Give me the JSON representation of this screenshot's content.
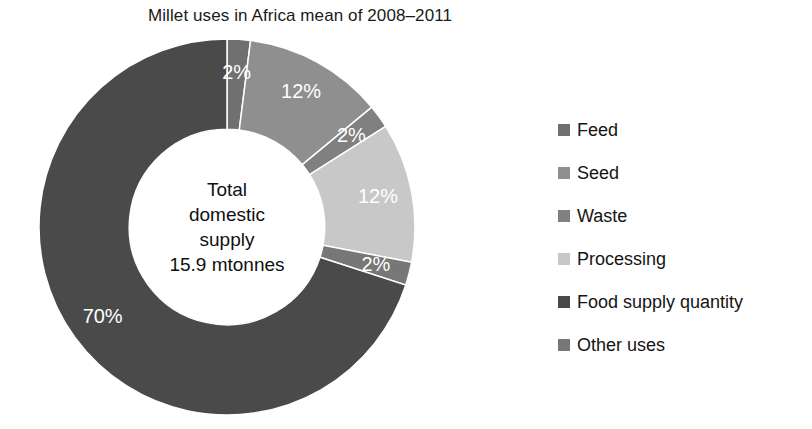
{
  "chart_data": {
    "type": "pie",
    "variant": "donut",
    "title": "Millet uses in Africa mean of 2008–2011",
    "center_label_lines": [
      "Total",
      "domestic",
      "supply",
      "15.9 mtonnes"
    ],
    "total_value": "15.9 mtonnes",
    "unit": "%",
    "start_angle_deg": 0,
    "direction": "clockwise",
    "inner_radius_ratio": 0.52,
    "legend_position": "right",
    "categories": [
      "Feed",
      "Seed",
      "Waste",
      "Processing",
      "Food supply quantity",
      "Other uses"
    ],
    "values": [
      2,
      12,
      2,
      12,
      70,
      2
    ],
    "data_labels": [
      "2%",
      "12%",
      "2%",
      "12%",
      "70%",
      "2%"
    ],
    "colors": [
      "#707070",
      "#8f8f8f",
      "#808080",
      "#c8c8c8",
      "#4a4a4a",
      "#777777"
    ],
    "draw_order": [
      {
        "name": "Feed",
        "value": 2,
        "label": "2%",
        "color": "#707070"
      },
      {
        "name": "Seed",
        "value": 12,
        "label": "12%",
        "color": "#8f8f8f"
      },
      {
        "name": "Waste",
        "value": 2,
        "label": "2%",
        "color": "#808080"
      },
      {
        "name": "Processing",
        "value": 12,
        "label": "12%",
        "color": "#c8c8c8"
      },
      {
        "name": "Other uses",
        "value": 2,
        "label": "2%",
        "color": "#777777"
      },
      {
        "name": "Food supply quantity",
        "value": 70,
        "label": "70%",
        "color": "#4a4a4a"
      }
    ],
    "xlabel": "",
    "ylabel": "",
    "grid": false
  },
  "legend": {
    "items": [
      {
        "label": "Feed",
        "color": "#707070"
      },
      {
        "label": "Seed",
        "color": "#8f8f8f"
      },
      {
        "label": "Waste",
        "color": "#808080"
      },
      {
        "label": "Processing",
        "color": "#c8c8c8"
      },
      {
        "label": "Food supply quantity",
        "color": "#4a4a4a"
      },
      {
        "label": "Other uses",
        "color": "#777777"
      }
    ]
  }
}
